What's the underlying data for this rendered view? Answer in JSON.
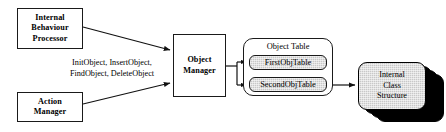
{
  "diagram": {
    "colors": {
      "stroke": "#1a1a1a",
      "fill_white": "#ffffff",
      "fill_gray": "#c8c8c8",
      "shadow": "#000000",
      "text": "#000000"
    },
    "nodes": {
      "internal_behaviour_processor": {
        "lines": [
          "Internal",
          "Behaviour",
          "Processor"
        ]
      },
      "action_manager": {
        "lines": [
          "Action",
          "Manager"
        ]
      },
      "object_manager": {
        "lines": [
          "Object",
          "Manager"
        ]
      },
      "object_table_group": {
        "title": "Object Table",
        "chips": [
          {
            "label": "FirstObjTable"
          },
          {
            "label": "SecondObjTable"
          }
        ]
      },
      "internal_class_structure": {
        "lines": [
          "Internal",
          "Class",
          "Structure"
        ],
        "stack_depth": 4
      }
    },
    "edge_labels": {
      "methods": [
        "InitObject, InsertObject,",
        "FindObject, DeleteObject"
      ]
    },
    "edges": [
      {
        "from": "internal_behaviour_processor",
        "to": "object_manager",
        "arrow": "single"
      },
      {
        "from": "action_manager",
        "to": "object_manager",
        "arrow": "single"
      },
      {
        "from": "object_manager",
        "to": "object_table_group",
        "arrow": "single"
      },
      {
        "from": "object_table_branch",
        "to": "FirstObjTable",
        "arrow": "single"
      },
      {
        "from": "object_table_branch",
        "to": "SecondObjTable",
        "arrow": "single"
      },
      {
        "from": "FirstObjTable",
        "to": "SecondObjTable",
        "arrow": "single"
      },
      {
        "from": "SecondObjTable",
        "to": "internal_class_structure",
        "arrow": "single"
      }
    ]
  }
}
